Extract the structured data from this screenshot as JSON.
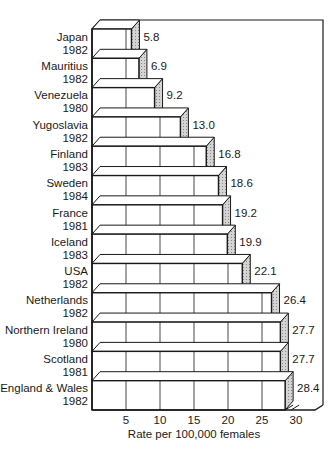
{
  "chart_data": {
    "type": "bar",
    "orientation": "horizontal",
    "style": "3d-stepped",
    "title": "",
    "xlabel": "Rate per 100,000 females",
    "ylabel": "",
    "xlim": [
      0,
      30
    ],
    "xticks": [
      5,
      10,
      15,
      20,
      25,
      30
    ],
    "grid": true,
    "categories": [
      {
        "country": "Japan",
        "year": "1982"
      },
      {
        "country": "Mauritius",
        "year": "1982"
      },
      {
        "country": "Venezuela",
        "year": "1980"
      },
      {
        "country": "Yugoslavia",
        "year": "1982"
      },
      {
        "country": "Finland",
        "year": "1983"
      },
      {
        "country": "Sweden",
        "year": "1984"
      },
      {
        "country": "France",
        "year": "1981"
      },
      {
        "country": "Iceland",
        "year": "1983"
      },
      {
        "country": "USA",
        "year": "1982"
      },
      {
        "country": "Netherlands",
        "year": "1982"
      },
      {
        "country": "Northern Ireland",
        "year": "1980"
      },
      {
        "country": "Scotland",
        "year": "1981"
      },
      {
        "country": "England & Wales",
        "year": "1982"
      }
    ],
    "values": [
      5.8,
      6.9,
      9.2,
      13.0,
      16.8,
      18.6,
      19.2,
      19.9,
      22.1,
      26.4,
      27.7,
      27.7,
      28.4
    ],
    "value_labels": [
      "5.8",
      "6.9",
      "9.2",
      "13.0",
      "16.8",
      "18.6",
      "19.2",
      "19.9",
      "22.1",
      "26.4",
      "27.7",
      "27.7",
      "28.4"
    ],
    "colors": {
      "bar_face": "#ffffff",
      "bar_side": "#d4d4d4",
      "line": "#1a1a1a"
    }
  }
}
